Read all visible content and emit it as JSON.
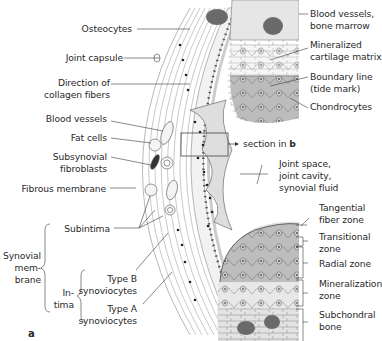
{
  "figure": {
    "panel_letter": "a",
    "section_ref_prefix": "section in ",
    "section_ref_bold": "b"
  },
  "labels_left": {
    "osteocytes": "Osteocytes",
    "joint_capsule": "Joint capsule",
    "direction_1": "Direction of",
    "direction_2": "collagen fibers",
    "blood_vessels": "Blood vessels",
    "fat_cells": "Fat cells",
    "subsynovial_1": "Subsynovial",
    "subsynovial_2": "fibroblasts",
    "fibrous_membrane": "Fibrous membrane",
    "subintima": "Subintima",
    "synovial_1": "Synovial",
    "synovial_2": "mem-",
    "synovial_3": "brane",
    "intima_1": "In-",
    "intima_2": "tima",
    "type_b_1": "Type B",
    "type_b_2": "synoviocytes",
    "type_a_1": "Type A",
    "type_a_2": "synoviocytes"
  },
  "labels_right": {
    "blood_vessels_1": "Blood vessels,",
    "blood_vessels_2": "bone marrow",
    "mineralized_1": "Mineralized",
    "mineralized_2": "cartilage matrix",
    "boundary_1": "Boundary line",
    "boundary_2": "(tide mark)",
    "chondrocytes": "Chondrocytes",
    "joint_space_1": "Joint space,",
    "joint_space_2": "joint cavity,",
    "joint_space_3": "synovial fluid",
    "tangential_1": "Tangential",
    "tangential_2": "fiber zone",
    "transitional_1": "Transitional",
    "transitional_2": "zone",
    "radial": "Radial zone",
    "mineralization_1": "Mineralization",
    "mineralization_2": "zone",
    "subchondral_1": "Subchondral",
    "subchondral_2": "bone"
  },
  "colors": {
    "line": "#3a3a3a",
    "cartilage_top": "#d8d8d8",
    "cartilage_dark": "#b9b9b9",
    "bone": "#e2e2e2",
    "marrow": "#6a6a6a",
    "capsule": "#f1f1f1",
    "cell_nucleus": "#222222"
  }
}
